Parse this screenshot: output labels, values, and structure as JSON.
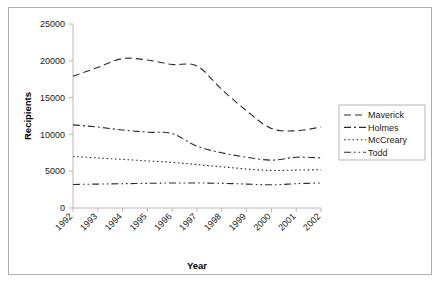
{
  "chart_data": {
    "type": "line",
    "title": "",
    "xlabel": "Year",
    "ylabel": "Recipients",
    "categories": [
      "1992",
      "1993",
      "1994",
      "1995",
      "1996",
      "1997",
      "1998",
      "1999",
      "2000",
      "2001",
      "2002"
    ],
    "x": [
      1992,
      1993,
      1994,
      1995,
      1996,
      1997,
      1998,
      1999,
      2000,
      2001,
      2002
    ],
    "ylim": [
      0,
      25000
    ],
    "yticks": [
      0,
      5000,
      10000,
      15000,
      20000,
      25000
    ],
    "ytick_labels": [
      "0",
      "5000",
      "10000",
      "15000",
      "20000",
      "25000"
    ],
    "grid": false,
    "legend_position": "right",
    "series": [
      {
        "name": "Maverick",
        "dash_style": "dashed",
        "color": "#2b2b2b",
        "values": [
          17900,
          19100,
          20300,
          20100,
          19500,
          19300,
          16100,
          13200,
          10800,
          10500,
          11000
        ]
      },
      {
        "name": "Holmes",
        "dash_style": "dash-dot",
        "color": "#2b2b2b",
        "values": [
          11300,
          11000,
          10600,
          10300,
          10100,
          8400,
          7500,
          6900,
          6500,
          6900,
          6800
        ]
      },
      {
        "name": "McCreary",
        "dash_style": "dotted",
        "color": "#2b2b2b",
        "values": [
          7000,
          6800,
          6600,
          6400,
          6200,
          5900,
          5600,
          5300,
          5100,
          5150,
          5200
        ]
      },
      {
        "name": "Todd",
        "dash_style": "dash-dot-dot",
        "color": "#2b2b2b",
        "values": [
          3200,
          3250,
          3300,
          3350,
          3400,
          3400,
          3350,
          3250,
          3150,
          3300,
          3400
        ]
      }
    ]
  },
  "axis": {
    "y_title": "Recipients",
    "x_title": "Year"
  },
  "legend": {
    "entries": [
      {
        "label": "Maverick"
      },
      {
        "label": "Holmes"
      },
      {
        "label": "McCreary"
      },
      {
        "label": "Todd"
      }
    ]
  }
}
